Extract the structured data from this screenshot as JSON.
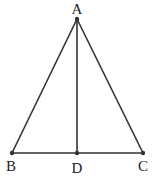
{
  "diagram": {
    "type": "isosceles triangle with altitude",
    "points": [
      {
        "name": "A",
        "label": "A",
        "x": 77,
        "y": 19,
        "label_x": 77,
        "label_y": 14
      },
      {
        "name": "B",
        "label": "B",
        "x": 12,
        "y": 153,
        "label_x": 11,
        "label_y": 171
      },
      {
        "name": "D",
        "label": "D",
        "x": 77,
        "y": 153,
        "label_x": 77,
        "label_y": 173
      },
      {
        "name": "C",
        "label": "C",
        "x": 143,
        "y": 153,
        "label_x": 143,
        "label_y": 171
      }
    ],
    "segments": [
      "AB",
      "AC",
      "BC",
      "AD"
    ],
    "stroke_color": "#333333",
    "point_color": "#333333"
  }
}
